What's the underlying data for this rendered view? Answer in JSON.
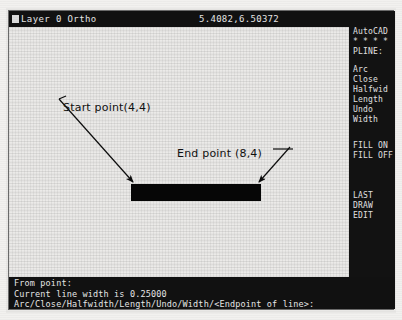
{
  "status_bar": {
    "layer_text": "Layer 0  Ortho",
    "coordinates": "5.4082,6.50372",
    "color_swatch": "#dcdcdc"
  },
  "drawing": {
    "annotations": [
      {
        "label": "Start point(4,4)",
        "point": "4,4"
      },
      {
        "label": "End point (8,4)",
        "point": "8,4"
      }
    ],
    "entity": {
      "name": "polyline",
      "fill_color": "#060606",
      "width": "0.25000"
    }
  },
  "side_menu": {
    "title": "AutoCAD",
    "separator": "* * * *",
    "active_command": "PLINE:",
    "options": [
      "Arc",
      "Close",
      "Halfwid",
      "Length",
      "Undo",
      "Width"
    ],
    "fill_options": [
      "FILL ON",
      "FILL OFF"
    ],
    "nav_options": [
      "LAST",
      "DRAW",
      "EDIT"
    ]
  },
  "command_line": {
    "lines": [
      "From point:",
      "Current line width is 0.25000",
      "Arc/Close/Halfwidth/Length/Undo/Width/<Endpoint of line>:"
    ]
  },
  "colors": {
    "background": "#ebeae8",
    "panel_black": "#111111",
    "text_light": "#e7e7e7",
    "ink": "#101010"
  }
}
